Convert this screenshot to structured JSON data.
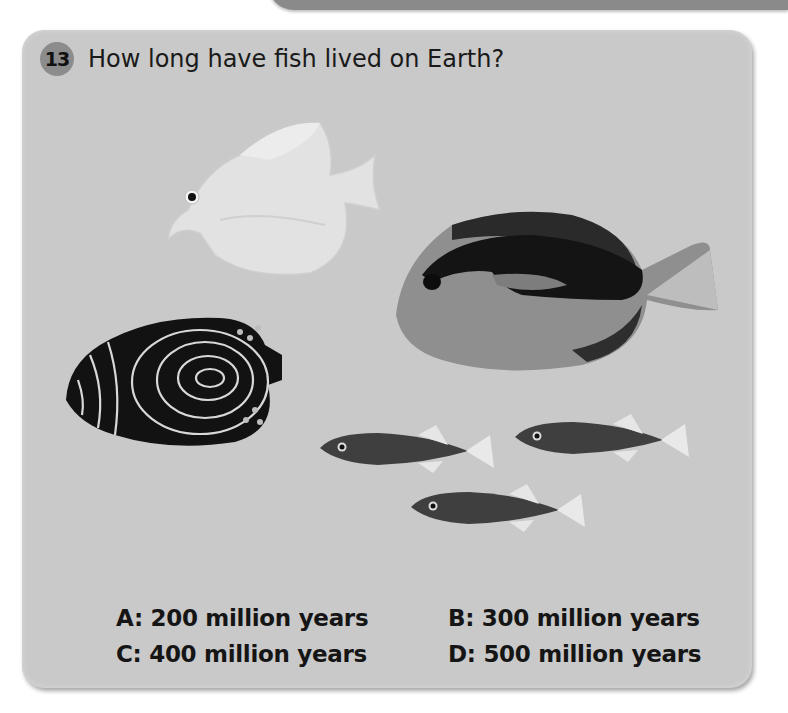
{
  "question": {
    "number": "13",
    "text": "How long have fish lived on Earth?"
  },
  "illustration": {
    "fish": [
      {
        "name": "pale-tang-fish",
        "tone": "#e0e0e0"
      },
      {
        "name": "striped-tang-fish",
        "tone": "#555555"
      },
      {
        "name": "emperor-angelfish-juvenile",
        "tone": "#151515"
      },
      {
        "name": "stickleback-fish-1",
        "tone": "#4a4a4a"
      },
      {
        "name": "stickleback-fish-2",
        "tone": "#4a4a4a"
      },
      {
        "name": "stickleback-fish-3",
        "tone": "#4a4a4a"
      }
    ]
  },
  "answers": [
    {
      "label": "A: 200 million years"
    },
    {
      "label": "B: 300 million years"
    },
    {
      "label": "C: 400 million years"
    },
    {
      "label": "D: 500 million years"
    }
  ],
  "colors": {
    "panel": "#c9c9c9",
    "badge": "#8c8c8c",
    "top_bar": "#8a8a8a"
  }
}
